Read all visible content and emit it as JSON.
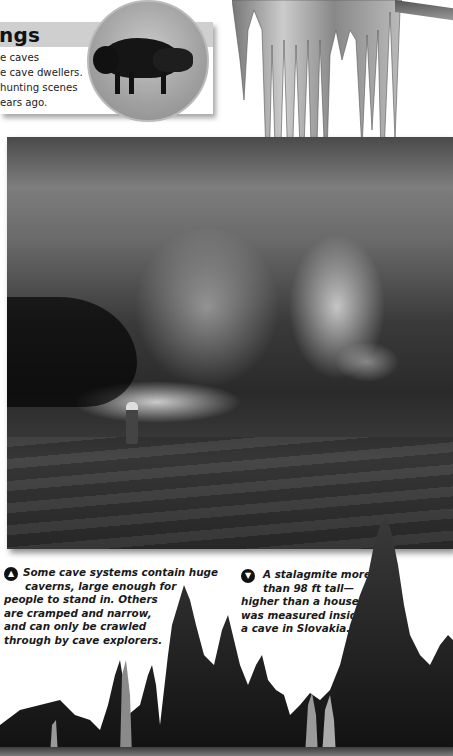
{
  "info_box": {
    "title_fragment": "ngs",
    "body_lines": [
      "e caves",
      "e cave dwellers.",
      "hunting scenes",
      "ears ago."
    ],
    "image": "bison-cave-painting"
  },
  "main_photo": {
    "subject": "large cave cavern with stalactites, flowstone and a caver with headlamp"
  },
  "captions": [
    {
      "icon": "arrow-up-icon",
      "lines": [
        "Some cave systems contain huge",
        "caverns, large enough for",
        "people to stand in. Others",
        "are cramped and narrow,",
        "and can only be crawled",
        "through by cave explorers."
      ]
    },
    {
      "icon": "arrow-down-icon",
      "lines": [
        "A stalagmite more",
        "than 98 ft tall—",
        "higher than a house—",
        "was measured inside",
        "a cave in Slovakia."
      ]
    }
  ],
  "icons": {
    "arrow_up": "▲",
    "arrow_down": "▼"
  },
  "colors": {
    "title_bar": "#cfcfcf",
    "text": "#1a1a1a",
    "background": "#ffffff"
  }
}
